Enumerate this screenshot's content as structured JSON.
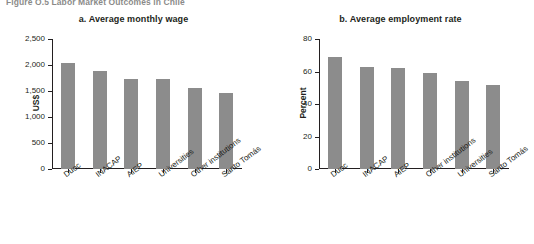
{
  "figure": {
    "title": "Figure O.5  Labor Market Outcomes in Chile"
  },
  "chart_data": [
    {
      "type": "bar",
      "panel": "a",
      "title": "a. Average monthly wage",
      "xlabel": "",
      "ylabel": "US$",
      "ylim": [
        0,
        2500
      ],
      "yticks": [
        0,
        500,
        1000,
        1500,
        2000,
        2500
      ],
      "ytick_labels": [
        "0",
        "500",
        "1,000",
        "1,500",
        "2,000",
        "2,500"
      ],
      "grid": false,
      "legend": "none",
      "bar_color": "#8c8c8c",
      "categories": [
        "Duoc",
        "INACAP",
        "AIEP",
        "Universities",
        "Other institutions",
        "Santo Tomás"
      ],
      "values": [
        2030,
        1880,
        1740,
        1730,
        1560,
        1470
      ]
    },
    {
      "type": "bar",
      "panel": "b",
      "title": "b. Average employment rate",
      "xlabel": "",
      "ylabel": "Percent",
      "ylim": [
        0,
        80
      ],
      "yticks": [
        0,
        20,
        40,
        60,
        80
      ],
      "ytick_labels": [
        "0",
        "20",
        "40",
        "60",
        "80"
      ],
      "grid": false,
      "legend": "none",
      "bar_color": "#8c8c8c",
      "categories": [
        "Duoc",
        "INACAP",
        "AIEP",
        "Other institutions",
        "Universities",
        "Santo Tomás"
      ],
      "values": [
        69,
        62.5,
        62,
        59,
        54,
        51.5
      ]
    }
  ]
}
